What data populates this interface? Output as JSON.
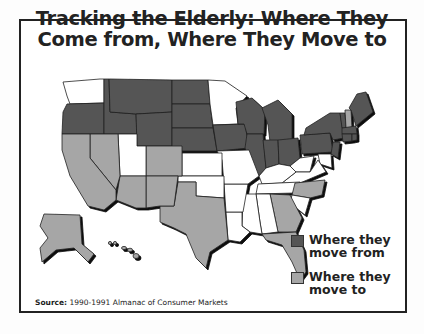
{
  "title": {
    "line1": "Tracking the Elderly: Where They",
    "line2": "Come from, Where They Move to"
  },
  "legend": {
    "items": [
      {
        "label_line1": "Where they",
        "label_line2": "move from",
        "color": "#555555"
      },
      {
        "label_line1": "Where they",
        "label_line2": "move to",
        "color": "#a6a6a6"
      }
    ]
  },
  "source": {
    "label": "Source:",
    "text": "1990-1991 Almanac of Consumer Markets"
  },
  "colors": {
    "move_from": "#555555",
    "move_to": "#a6a6a6",
    "neutral": "#ffffff",
    "outline": "#222222"
  },
  "regions": {
    "move_from": [
      "OR",
      "ID",
      "MT",
      "WY",
      "ND",
      "SD",
      "NE",
      "IA",
      "WI",
      "MI",
      "IL",
      "IN",
      "OH",
      "PA",
      "NY",
      "VT",
      "ME",
      "MA",
      "CT",
      "RI",
      "NJ",
      "MN-part"
    ],
    "move_to": [
      "CA",
      "NV",
      "AZ",
      "NM",
      "CO",
      "TX",
      "FL",
      "GA",
      "NC",
      "AK",
      "HI",
      "NH"
    ],
    "neutral": [
      "WA",
      "UT",
      "KS",
      "OK",
      "MO",
      "AR",
      "LA",
      "MS",
      "AL",
      "TN",
      "KY",
      "WV",
      "VA",
      "SC",
      "MN",
      "MD",
      "DE"
    ]
  }
}
